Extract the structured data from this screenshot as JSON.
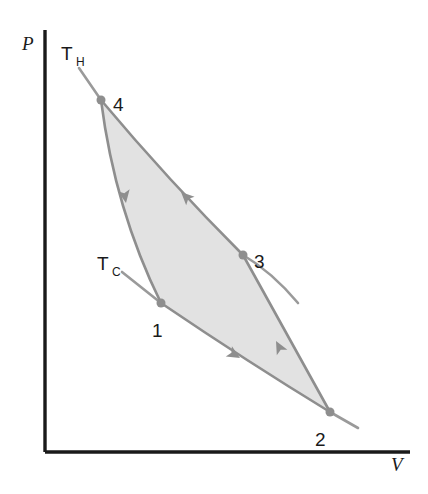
{
  "figure": {
    "type": "pv-diagram",
    "title": "",
    "background_color": "#ffffff",
    "axes": {
      "y_label": "P",
      "x_label": "V",
      "axis_color": "#1a1a1a",
      "origin": [
        45,
        452
      ],
      "y_top": [
        45,
        30
      ],
      "x_right": [
        410,
        452
      ],
      "y_label_pos": [
        24,
        50
      ],
      "x_label_pos": [
        392,
        470
      ]
    },
    "isotherms": [
      {
        "name": "hot-isotherm",
        "label": "T",
        "subscript": "H",
        "label_pos": [
          62,
          58
        ],
        "subscript_pos": [
          78,
          64
        ],
        "color": "#9a9a9a",
        "path": "M 79,68 L 101,100",
        "description": "hot isotherm through state 4"
      },
      {
        "name": "cold-isotherm-left",
        "label": "T",
        "subscript": "C",
        "label_pos": [
          98,
          268
        ],
        "subscript_pos": [
          113,
          274
        ],
        "color": "#9a9a9a",
        "path": "M 122,272 L 161,303",
        "description": "cold isotherm tail left of state 1"
      },
      {
        "name": "cold-isotherm-right",
        "label": "",
        "subscript": "",
        "color": "#9a9a9a",
        "path": "M 243,255 Q 272,272 298,303",
        "description": "cold isotherm tail right of state 3"
      },
      {
        "name": "hot-isotherm-right",
        "label": "",
        "subscript": "",
        "color": "#9a9a9a",
        "path": "M 330,412 L 358,428",
        "description": "hot isotherm tail right of state 2"
      }
    ],
    "cycle": {
      "fill_color": "#e2e2e2",
      "stroke_color": "#8e8e8e",
      "direction": "1-2-3-4-1",
      "states": [
        {
          "label": "1",
          "point": [
            161,
            303
          ],
          "label_pos": [
            152,
            330
          ]
        },
        {
          "label": "2",
          "point": [
            330,
            412
          ],
          "label_pos": [
            316,
            439
          ]
        },
        {
          "label": "3",
          "point": [
            243,
            255
          ],
          "label_pos": [
            255,
            261
          ]
        },
        {
          "label": "4",
          "point": [
            101,
            100
          ],
          "label_pos": [
            113,
            104
          ]
        }
      ],
      "segments": [
        {
          "name": "segment-1-2",
          "from": "1",
          "to": "2",
          "path": "M 161,303 Q 248,362 330,412",
          "arrow_at": [
            240,
            358
          ],
          "arrow_angle": 31
        },
        {
          "name": "segment-2-3",
          "from": "2",
          "to": "3",
          "path": "M 330,412 Q 297,352 243,255",
          "arrow_at": [
            276,
            341
          ],
          "arrow_angle": 242
        },
        {
          "name": "segment-3-4",
          "from": "3",
          "to": "4",
          "path": "M 243,255 Q 168,180 101,100",
          "arrow_at": [
            181,
            192
          ],
          "arrow_angle": 224
        },
        {
          "name": "segment-4-1",
          "from": "4",
          "to": "1",
          "path": "M 101,100 Q 115,210 161,303",
          "arrow_at": [
            126,
            203
          ],
          "arrow_angle": 80
        }
      ]
    },
    "point_marker_color": "#8e8e8e",
    "point_marker_radius": 4.5
  }
}
